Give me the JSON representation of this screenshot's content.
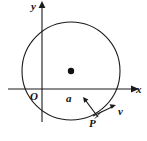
{
  "figure": {
    "background_color": "#ffffff",
    "stroke_color": "#1a1a1a"
  },
  "axes": {
    "x_axis": {
      "label": "x",
      "y_pixel": 89,
      "x_start": 8,
      "x_end": 134,
      "arrow": "right"
    },
    "y_axis": {
      "label": "y",
      "x_pixel": 42,
      "y_start": 122,
      "y_end": 5,
      "arrow": "up"
    },
    "origin": {
      "label": "O",
      "x_pixel": 42,
      "y_pixel": 89
    }
  },
  "circle": {
    "center_x": 71,
    "center_y": 71,
    "radius": 49,
    "center_dot_radius": 3.2,
    "center_dot_color": "#111111",
    "stroke_width": 1.1
  },
  "point_P": {
    "label": "P",
    "x_pixel": 96,
    "y_pixel": 113,
    "marker": "none"
  },
  "vectors": [
    {
      "name": "acceleration",
      "label": "a",
      "from_x": 98,
      "from_y": 117,
      "to_x": 83,
      "to_y": 97,
      "direction": "toward-center",
      "arrow_head": "end"
    },
    {
      "name": "velocity",
      "label": "v",
      "from_x": 93,
      "from_y": 116,
      "to_x": 116,
      "to_y": 105,
      "direction": "tangent",
      "arrow_head": "end"
    }
  ],
  "leader_line": {
    "name": "P-leader",
    "from_x": 95,
    "from_y": 118,
    "to_x": 103,
    "to_y": 110
  }
}
